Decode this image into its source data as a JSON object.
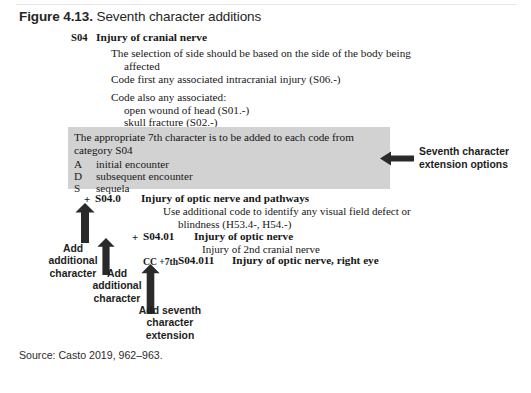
{
  "figure": {
    "caption_number": "Figure 4.13.",
    "caption_text": " Seventh character additions",
    "source": "Source: Casto 2019, 962–963."
  },
  "category": {
    "code": "S04",
    "title": "Injury of cranial nerve",
    "notes": [
      "The selection of side should be based on the side of the body being",
      "affected",
      "Code first any associated intracranial injury (S06.-)",
      "Code also any associated:",
      "open wound of head (S01.-)",
      "skull fracture (S02.-)"
    ]
  },
  "seventh_character_box": {
    "intro_line1": "The appropriate 7th character is to be added to each code from",
    "intro_line2": "category S04",
    "options": [
      {
        "letter": "A",
        "meaning": "initial encounter"
      },
      {
        "letter": "D",
        "meaning": "subsequent encounter"
      },
      {
        "letter": "S",
        "meaning": "sequela"
      }
    ],
    "shade_color": "#d2d2d2"
  },
  "annotations": {
    "seventh_character_options": "Seventh character\nextension options",
    "add_additional_character_1": "Add\nadditional\ncharacter",
    "add_additional_character_2": "Add\nadditional\ncharacter",
    "add_seventh_character_extension": "Add seventh\ncharacter\nextension"
  },
  "codes": [
    {
      "plus": "+",
      "code": "S04.0",
      "description": "Injury of optic nerve and pathways",
      "notes": [
        "Use additional code to identify any visual field defect or",
        "blindness (H53.4-, H54.-)"
      ]
    },
    {
      "plus": "+",
      "code": "S04.01",
      "description": "Injury of optic nerve",
      "notes": [
        "Injury of 2nd cranial nerve"
      ]
    },
    {
      "prefix": "CC +7th",
      "code": "S04.011",
      "description": "Injury of optic nerve, right eye",
      "notes": []
    }
  ]
}
